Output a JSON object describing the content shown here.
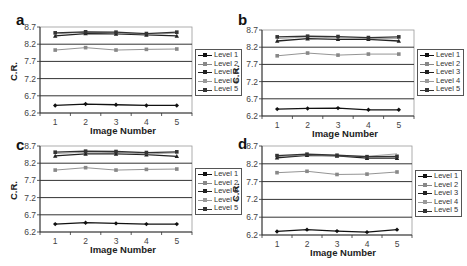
{
  "figure": {
    "panels": [
      "a",
      "b",
      "c",
      "d"
    ]
  },
  "legend": {
    "items": [
      "Level 1",
      "Level 2",
      "Level 3",
      "Level 4",
      "Level 5"
    ]
  },
  "axes": {
    "xlabel": "Image Number",
    "ylabel": "C.R.",
    "yticks": [
      "8.7",
      "8.2",
      "7.7",
      "7.2",
      "6.7",
      "6.2"
    ],
    "xticks": [
      "1",
      "2",
      "3",
      "4",
      "5"
    ]
  },
  "colors": {
    "level1": "#111111",
    "level2": "#888888",
    "level3": "#222222",
    "level4": "#9a9a9a",
    "level5": "#333333",
    "grid": "#333333",
    "frame": "#999999"
  },
  "chart_data": [
    {
      "panel": "a",
      "type": "line",
      "title": "",
      "xlabel": "Image Number",
      "ylabel": "C.R.",
      "x": [
        1,
        2,
        3,
        4,
        5
      ],
      "ylim": [
        6.2,
        8.7
      ],
      "yticks": [
        6.2,
        6.7,
        7.2,
        7.7,
        8.2,
        8.7
      ],
      "grid": true,
      "legend_position": "right",
      "series": [
        {
          "name": "Level 1",
          "values": [
            6.42,
            6.46,
            6.44,
            6.42,
            6.42
          ]
        },
        {
          "name": "Level 2",
          "values": [
            8.03,
            8.1,
            8.03,
            8.05,
            8.06
          ]
        },
        {
          "name": "Level 3",
          "values": [
            8.44,
            8.51,
            8.5,
            8.47,
            8.44
          ]
        },
        {
          "name": "Level 4",
          "values": [
            8.5,
            8.55,
            8.53,
            8.49,
            8.52
          ]
        },
        {
          "name": "Level 5",
          "values": [
            8.53,
            8.56,
            8.55,
            8.51,
            8.55
          ]
        }
      ]
    },
    {
      "panel": "b",
      "type": "line",
      "title": "",
      "xlabel": "Image Number",
      "ylabel": "C.R.",
      "x": [
        1,
        2,
        3,
        4,
        5
      ],
      "ylim": [
        6.2,
        8.7
      ],
      "yticks": [
        6.2,
        6.7,
        7.2,
        7.7,
        8.2,
        8.7
      ],
      "grid": true,
      "legend_position": "right",
      "series": [
        {
          "name": "Level 1",
          "values": [
            6.4,
            6.42,
            6.43,
            6.38,
            6.38
          ]
        },
        {
          "name": "Level 2",
          "values": [
            7.95,
            8.03,
            7.97,
            8.0,
            8.0
          ]
        },
        {
          "name": "Level 3",
          "values": [
            8.38,
            8.45,
            8.43,
            8.43,
            8.38
          ]
        },
        {
          "name": "Level 4",
          "values": [
            8.45,
            8.5,
            8.47,
            8.45,
            8.45
          ]
        },
        {
          "name": "Level 5",
          "values": [
            8.5,
            8.52,
            8.51,
            8.48,
            8.5
          ]
        }
      ]
    },
    {
      "panel": "c",
      "type": "line",
      "title": "",
      "xlabel": "Image Number",
      "ylabel": "C.R.",
      "x": [
        1,
        2,
        3,
        4,
        5
      ],
      "ylim": [
        6.2,
        8.7
      ],
      "yticks": [
        6.2,
        6.7,
        7.2,
        7.7,
        8.2,
        8.7
      ],
      "grid": true,
      "legend_position": "right",
      "series": [
        {
          "name": "Level 1",
          "values": [
            6.43,
            6.47,
            6.45,
            6.43,
            6.43
          ]
        },
        {
          "name": "Level 2",
          "values": [
            8.0,
            8.07,
            8.0,
            8.02,
            8.03
          ]
        },
        {
          "name": "Level 3",
          "values": [
            8.41,
            8.47,
            8.47,
            8.45,
            8.4
          ]
        },
        {
          "name": "Level 4",
          "values": [
            8.48,
            8.52,
            8.51,
            8.47,
            8.5
          ]
        },
        {
          "name": "Level 5",
          "values": [
            8.52,
            8.55,
            8.54,
            8.51,
            8.53
          ]
        }
      ]
    },
    {
      "panel": "d",
      "type": "line",
      "title": "",
      "xlabel": "Image Number",
      "ylabel": "C.R.",
      "x": [
        1,
        2,
        3,
        4,
        5
      ],
      "ylim": [
        6.2,
        8.7
      ],
      "yticks": [
        6.2,
        6.7,
        7.2,
        7.7,
        8.2,
        8.7
      ],
      "grid": true,
      "legend_position": "right",
      "series": [
        {
          "name": "Level 1",
          "values": [
            6.3,
            6.35,
            6.31,
            6.28,
            6.35
          ]
        },
        {
          "name": "Level 2",
          "values": [
            7.95,
            7.99,
            7.9,
            7.91,
            7.97
          ]
        },
        {
          "name": "Level 3",
          "values": [
            8.37,
            8.44,
            8.42,
            8.36,
            8.36
          ]
        },
        {
          "name": "Level 4",
          "values": [
            8.4,
            8.45,
            8.43,
            8.41,
            8.48
          ]
        },
        {
          "name": "Level 5",
          "values": [
            8.43,
            8.47,
            8.44,
            8.4,
            8.41
          ]
        }
      ]
    }
  ]
}
